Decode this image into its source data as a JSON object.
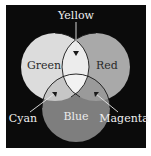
{
  "diagram": {
    "type": "venn-additive-color",
    "background": "#0b0b0b",
    "circles": [
      {
        "name": "Green",
        "label": "Green",
        "fill": "#dcdcdc",
        "cx": 55,
        "cy": 67,
        "r": 34
      },
      {
        "name": "Red",
        "label": "Red",
        "fill": "#a9a9a9",
        "cx": 96,
        "cy": 67,
        "r": 34
      },
      {
        "name": "Blue",
        "label": "Blue",
        "fill": "#7e7e7e",
        "cx": 76,
        "cy": 108,
        "r": 34
      }
    ],
    "intersections": [
      {
        "name": "Yellow",
        "label": "Yellow",
        "between": [
          "Green",
          "Red"
        ],
        "fill": "#ececec"
      },
      {
        "name": "Cyan",
        "label": "Cyan",
        "between": [
          "Green",
          "Blue"
        ],
        "fill": "#c6c6c6"
      },
      {
        "name": "Magenta",
        "label": "Magenta",
        "between": [
          "Red",
          "Blue"
        ],
        "fill": "#9a9a9a"
      },
      {
        "name": "White",
        "between": [
          "Green",
          "Red",
          "Blue"
        ],
        "fill": "#f2f2f2"
      }
    ],
    "outline_color": "#1a1a1a",
    "label_colors": {
      "inside": "#2a2a2a",
      "outside": "#f0f0f0",
      "blue": "#ececec"
    }
  }
}
